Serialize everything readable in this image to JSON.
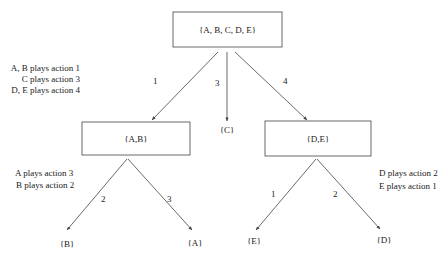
{
  "diagram": {
    "type": "tree",
    "root": {
      "label": "{A, B, C, D, E}"
    },
    "nodes": {
      "ab": {
        "label": "{A,B}"
      },
      "c": {
        "label": "{C}"
      },
      "de": {
        "label": "{D,E}"
      },
      "b": {
        "label": "{B}"
      },
      "a": {
        "label": "{A}"
      },
      "e": {
        "label": "{E}"
      },
      "d": {
        "label": "{D}"
      }
    },
    "edges": {
      "root_ab": "1",
      "root_c": "3",
      "root_de": "4",
      "ab_b": "2",
      "ab_a": "3",
      "de_e": "1",
      "de_d": "2"
    },
    "annotations": {
      "root": [
        "A, B plays action 1",
        "C plays action 3",
        "D, E plays action 4"
      ],
      "ab": [
        "A plays action 3",
        "B plays action 2"
      ],
      "de": [
        "D plays action 2",
        "E plays action 1"
      ]
    }
  }
}
